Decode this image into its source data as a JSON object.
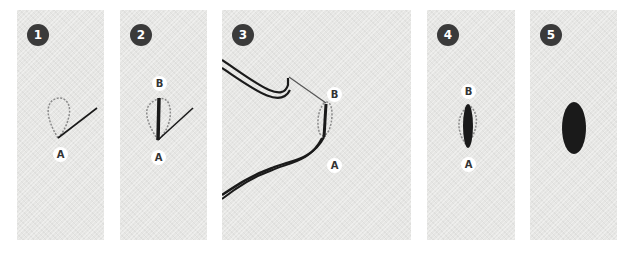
{
  "figure": {
    "background": "#ffffff",
    "fabric_color": "#e6e6e4",
    "thread_color": "#1a1a1a",
    "badge_color": "#3a3a3a",
    "steps": [
      {
        "number": "1",
        "labels": {
          "A": "A"
        },
        "description": "Needle emerges at A with a loop of thread"
      },
      {
        "number": "2",
        "labels": {
          "A": "A",
          "B": "B"
        },
        "description": "Straight stitch from A to B inside loop"
      },
      {
        "number": "3",
        "labels": {
          "A": "A",
          "B": "B"
        },
        "description": "Needle and working thread pulled through at B"
      },
      {
        "number": "4",
        "labels": {
          "A": "A",
          "B": "B"
        },
        "description": "Thread laid from A to B, loop outline visible"
      },
      {
        "number": "5",
        "labels": {},
        "description": "Finished filled oval stitch"
      }
    ]
  }
}
